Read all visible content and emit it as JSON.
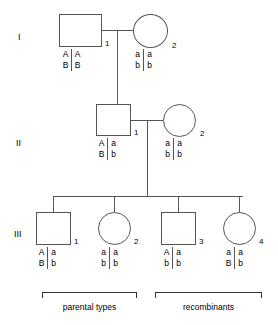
{
  "diagram": {
    "line_color": "#555555",
    "text_color": "#000000",
    "background": "#ffffff"
  },
  "generations": [
    {
      "label": "I"
    },
    {
      "label": "II"
    },
    {
      "label": "III"
    }
  ],
  "individuals": [
    {
      "id": "I-1",
      "sex": "male",
      "number": "1",
      "genotype": {
        "top_left": "A",
        "top_right": "A",
        "bottom_left": "B",
        "bottom_right": "B"
      }
    },
    {
      "id": "I-2",
      "sex": "female",
      "number": "2",
      "genotype": {
        "top_left": "a",
        "top_right": "a",
        "bottom_left": "b",
        "bottom_right": "b"
      }
    },
    {
      "id": "II-1",
      "sex": "male",
      "number": "1",
      "genotype": {
        "top_left": "A",
        "top_right": "a",
        "bottom_left": "B",
        "bottom_right": "b"
      }
    },
    {
      "id": "II-2",
      "sex": "female",
      "number": "2",
      "genotype": {
        "top_left": "a",
        "top_right": "a",
        "bottom_left": "b",
        "bottom_right": "b"
      }
    },
    {
      "id": "III-1",
      "sex": "male",
      "number": "1",
      "genotype": {
        "top_left": "A",
        "top_right": "a",
        "bottom_left": "B",
        "bottom_right": "b"
      }
    },
    {
      "id": "III-2",
      "sex": "female",
      "number": "2",
      "genotype": {
        "top_left": "a",
        "top_right": "a",
        "bottom_left": "b",
        "bottom_right": "b"
      }
    },
    {
      "id": "III-3",
      "sex": "male",
      "number": "3",
      "genotype": {
        "top_left": "A",
        "top_right": "a",
        "bottom_left": "b",
        "bottom_right": "b"
      }
    },
    {
      "id": "III-4",
      "sex": "female",
      "number": "4",
      "genotype": {
        "top_left": "a",
        "top_right": "a",
        "bottom_left": "B",
        "bottom_right": "b"
      }
    }
  ],
  "brackets": [
    {
      "label": "parental types",
      "covers": [
        "III-1",
        "III-2"
      ]
    },
    {
      "label": "recombinants",
      "covers": [
        "III-3",
        "III-4"
      ]
    }
  ]
}
